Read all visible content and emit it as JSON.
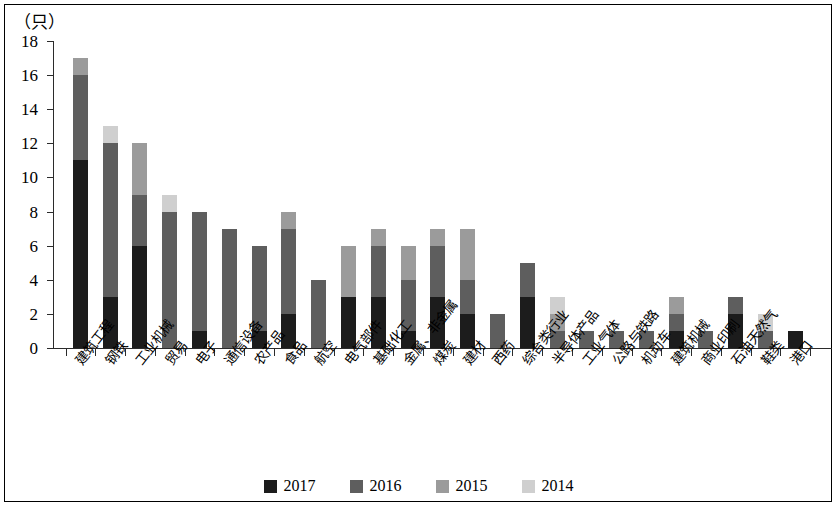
{
  "unit_label": "（只）",
  "legend": {
    "items": [
      {
        "label": "2017",
        "color": "#1c1c1c"
      },
      {
        "label": "2016",
        "color": "#5e5e5e"
      },
      {
        "label": "2015",
        "color": "#9b9b9b"
      },
      {
        "label": "2014",
        "color": "#cfcfcf"
      }
    ]
  },
  "chart_data": {
    "type": "bar",
    "stacked": true,
    "title": "",
    "subtitle": "",
    "xlabel": "",
    "ylabel": "（只）",
    "ylim": [
      0,
      18
    ],
    "yticks": [
      0,
      2,
      4,
      6,
      8,
      10,
      12,
      14,
      16,
      18
    ],
    "grid": false,
    "legend_position": "bottom",
    "categories": [
      "建筑工程",
      "钢铁",
      "工业机械",
      "贸易",
      "电子",
      "通信设备",
      "农产品",
      "食品",
      "航空",
      "电气部件",
      "基础化工",
      "金属、非金属",
      "煤炭",
      "建材",
      "西药",
      "综合类行业",
      "半导体产品",
      "工业气体",
      "公路与铁路",
      "机动车",
      "建筑机械",
      "商业印刷",
      "石油天然气",
      "鞋类",
      "港口"
    ],
    "series": [
      {
        "name": "2017",
        "color": "#1c1c1c",
        "values": [
          11,
          3,
          6,
          0,
          1,
          0,
          1,
          2,
          0,
          3,
          3,
          1,
          3,
          2,
          0,
          3,
          0,
          0,
          0,
          0,
          1,
          0,
          2,
          0,
          1
        ]
      },
      {
        "name": "2016",
        "color": "#5e5e5e",
        "values": [
          5,
          9,
          3,
          8,
          7,
          7,
          5,
          5,
          4,
          0,
          3,
          3,
          3,
          2,
          2,
          2,
          1,
          1,
          1,
          1,
          1,
          1,
          1,
          1,
          0
        ]
      },
      {
        "name": "2015",
        "color": "#9b9b9b",
        "values": [
          1,
          0,
          3,
          0,
          0,
          0,
          0,
          1,
          0,
          3,
          1,
          2,
          1,
          3,
          0,
          0,
          1,
          0,
          0,
          0,
          1,
          0,
          0,
          0,
          0
        ]
      },
      {
        "name": "2014",
        "color": "#cfcfcf",
        "values": [
          0,
          1,
          0,
          1,
          0,
          0,
          0,
          0,
          0,
          0,
          0,
          0,
          0,
          0,
          0,
          0,
          1,
          0,
          0,
          0,
          0,
          0,
          0,
          1,
          0
        ]
      }
    ],
    "totals": [
      17,
      13,
      12,
      9,
      8,
      7,
      6,
      8,
      4,
      6,
      7,
      6,
      7,
      7,
      2,
      5,
      3,
      1,
      1,
      1,
      3,
      1,
      3,
      2,
      1
    ]
  }
}
